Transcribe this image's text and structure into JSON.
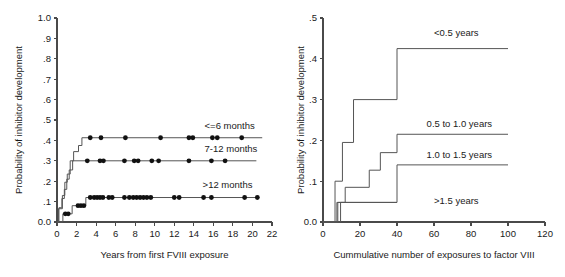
{
  "figure": {
    "background_color": "#ffffff",
    "axis_color": "#4a4a4a",
    "curve_color": "#555555",
    "marker_color": "#111111"
  },
  "chart_data": [
    {
      "type": "line",
      "id": "left",
      "title": "",
      "xlabel": "Years from first FVIII exposure",
      "ylabel": "Probability of inhibitor development",
      "xlim": [
        0,
        22
      ],
      "ylim": [
        0.0,
        1.0
      ],
      "xticks": [
        0,
        2,
        4,
        6,
        8,
        10,
        12,
        14,
        16,
        18,
        20,
        22
      ],
      "xtick_labels": [
        "0",
        "2",
        "4",
        "6",
        "8",
        "10",
        "12",
        "14",
        "16",
        "18",
        "20",
        "22"
      ],
      "yticks": [
        0.0,
        0.1,
        0.2,
        0.3,
        0.4,
        0.5,
        0.6,
        0.7,
        0.8,
        0.9,
        1.0
      ],
      "ytick_labels": [
        "0.0",
        ".1",
        ".2",
        ".3",
        ".4",
        ".5",
        ".6",
        ".7",
        ".8",
        ".9",
        "1.0"
      ],
      "grid": false,
      "legend_position": "inline-right",
      "series": [
        {
          "name": "<=6 months",
          "label_x": 15.1,
          "label_y": 0.455,
          "steps": [
            [
              0.0,
              0.0
            ],
            [
              0.15,
              0.0
            ],
            [
              0.15,
              0.065
            ],
            [
              0.55,
              0.065
            ],
            [
              0.55,
              0.13
            ],
            [
              0.8,
              0.13
            ],
            [
              0.8,
              0.195
            ],
            [
              1.05,
              0.195
            ],
            [
              1.05,
              0.235
            ],
            [
              1.35,
              0.235
            ],
            [
              1.35,
              0.3
            ],
            [
              1.7,
              0.3
            ],
            [
              1.7,
              0.345
            ],
            [
              2.2,
              0.345
            ],
            [
              2.2,
              0.375
            ],
            [
              2.55,
              0.375
            ],
            [
              2.55,
              0.413
            ],
            [
              21.0,
              0.413
            ]
          ],
          "censor_points": [
            [
              3.4,
              0.413
            ],
            [
              4.5,
              0.413
            ],
            [
              7.0,
              0.413
            ],
            [
              10.6,
              0.413
            ],
            [
              13.5,
              0.413
            ],
            [
              13.9,
              0.413
            ],
            [
              15.9,
              0.413
            ],
            [
              16.4,
              0.413
            ],
            [
              18.9,
              0.413
            ]
          ]
        },
        {
          "name": "7-12 months",
          "label_x": 15.1,
          "label_y": 0.343,
          "steps": [
            [
              0.0,
              0.0
            ],
            [
              0.2,
              0.0
            ],
            [
              0.2,
              0.07
            ],
            [
              0.5,
              0.07
            ],
            [
              0.5,
              0.115
            ],
            [
              0.75,
              0.115
            ],
            [
              0.75,
              0.16
            ],
            [
              1.0,
              0.16
            ],
            [
              1.0,
              0.21
            ],
            [
              1.25,
              0.21
            ],
            [
              1.25,
              0.255
            ],
            [
              1.6,
              0.255
            ],
            [
              1.6,
              0.3
            ],
            [
              20.4,
              0.3
            ]
          ],
          "censor_points": [
            [
              3.1,
              0.3
            ],
            [
              4.4,
              0.3
            ],
            [
              4.75,
              0.3
            ],
            [
              6.9,
              0.3
            ],
            [
              7.9,
              0.3
            ],
            [
              8.3,
              0.3
            ],
            [
              9.7,
              0.3
            ],
            [
              10.4,
              0.3
            ],
            [
              13.5,
              0.3
            ],
            [
              15.8,
              0.3
            ],
            [
              17.2,
              0.3
            ]
          ]
        },
        {
          "name": ">12 months",
          "label_x": 14.9,
          "label_y": 0.165,
          "steps": [
            [
              0.0,
              0.0
            ],
            [
              0.6,
              0.0
            ],
            [
              0.6,
              0.04
            ],
            [
              1.55,
              0.04
            ],
            [
              1.55,
              0.08
            ],
            [
              2.95,
              0.08
            ],
            [
              2.95,
              0.12
            ],
            [
              20.7,
              0.12
            ]
          ],
          "censor_points": [
            [
              0.85,
              0.04
            ],
            [
              1.15,
              0.04
            ],
            [
              2.15,
              0.08
            ],
            [
              2.45,
              0.08
            ],
            [
              2.75,
              0.08
            ],
            [
              3.4,
              0.12
            ],
            [
              3.8,
              0.12
            ],
            [
              4.1,
              0.12
            ],
            [
              4.4,
              0.12
            ],
            [
              4.7,
              0.12
            ],
            [
              5.3,
              0.12
            ],
            [
              5.65,
              0.12
            ],
            [
              6.9,
              0.12
            ],
            [
              7.4,
              0.12
            ],
            [
              7.8,
              0.12
            ],
            [
              8.15,
              0.12
            ],
            [
              8.5,
              0.12
            ],
            [
              8.85,
              0.12
            ],
            [
              9.2,
              0.12
            ],
            [
              9.6,
              0.12
            ],
            [
              12.0,
              0.12
            ],
            [
              12.5,
              0.12
            ],
            [
              15.0,
              0.12
            ],
            [
              15.8,
              0.12
            ],
            [
              19.2,
              0.12
            ],
            [
              20.5,
              0.12
            ]
          ]
        }
      ]
    },
    {
      "type": "line",
      "id": "right",
      "title": "",
      "xlabel": "Cummulative number of exposures to factor VIII",
      "ylabel": "Probability of inhibitor development",
      "xlim": [
        0,
        120
      ],
      "ylim": [
        0.0,
        0.5
      ],
      "xticks": [
        0,
        20,
        40,
        60,
        80,
        100,
        120
      ],
      "xtick_labels": [
        "0",
        "20",
        "40",
        "60",
        "80",
        "100",
        "120"
      ],
      "yticks": [
        0.0,
        0.1,
        0.2,
        0.3,
        0.4,
        0.5
      ],
      "ytick_labels": [
        "0.0",
        ".1",
        ".2",
        ".3",
        ".4",
        ".5"
      ],
      "grid": false,
      "legend_position": "inline-right",
      "series": [
        {
          "name": "<0.5 years",
          "label_x": 60,
          "label_y": 0.455,
          "steps": [
            [
              0.0,
              0.0
            ],
            [
              6.5,
              0.0
            ],
            [
              6.5,
              0.1
            ],
            [
              10.5,
              0.1
            ],
            [
              10.5,
              0.195
            ],
            [
              16.5,
              0.195
            ],
            [
              16.5,
              0.3
            ],
            [
              40.0,
              0.3
            ],
            [
              40.0,
              0.425
            ],
            [
              100.0,
              0.425
            ]
          ],
          "censor_points": []
        },
        {
          "name": "0.5 to 1.0 years",
          "label_x": 56,
          "label_y": 0.232,
          "steps": [
            [
              0.0,
              0.0
            ],
            [
              8.0,
              0.0
            ],
            [
              8.0,
              0.048
            ],
            [
              12.0,
              0.048
            ],
            [
              12.0,
              0.085
            ],
            [
              25.0,
              0.085
            ],
            [
              25.0,
              0.127
            ],
            [
              31.0,
              0.127
            ],
            [
              31.0,
              0.17
            ],
            [
              40.0,
              0.17
            ],
            [
              40.0,
              0.215
            ],
            [
              100.0,
              0.215
            ]
          ],
          "censor_points": []
        },
        {
          "name": "1.0 to 1.5 years",
          "label_x": 56,
          "label_y": 0.158,
          "steps": [
            [
              0.0,
              0.0
            ],
            [
              9.5,
              0.0
            ],
            [
              9.5,
              0.048
            ],
            [
              40.0,
              0.048
            ],
            [
              40.0,
              0.14
            ],
            [
              100.0,
              0.14
            ]
          ],
          "censor_points": []
        },
        {
          "name": ">1.5 years",
          "label_x": 60,
          "label_y": 0.045,
          "steps": [
            [
              0.0,
              0.0
            ],
            [
              7.5,
              0.0
            ],
            [
              7.5,
              0.048
            ],
            [
              40.0,
              0.048
            ]
          ],
          "censor_points": []
        }
      ]
    }
  ]
}
